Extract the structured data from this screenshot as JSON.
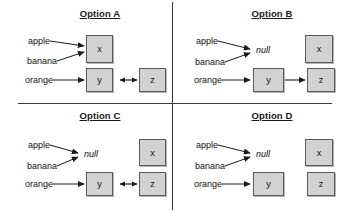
{
  "figure": {
    "layout": "2x2-quadrants",
    "colors": {
      "box_fill": "#d2d2d2",
      "box_border": "#5a5a5a",
      "line": "#1a1a1a",
      "background": "#ffffff"
    },
    "quadrants": [
      {
        "id": "option-a",
        "title": "Option A",
        "keys": [
          "apple",
          "banana",
          "orange"
        ],
        "null_label": null,
        "nodes": [
          {
            "id": "x",
            "label": "x",
            "col": 1,
            "row": 1
          },
          {
            "id": "y",
            "label": "y",
            "col": 1,
            "row": 2
          },
          {
            "id": "z",
            "label": "z",
            "col": 2,
            "row": 2
          }
        ],
        "edges": [
          {
            "from": "apple",
            "to": "x",
            "type": "arrow"
          },
          {
            "from": "banana",
            "to": "x",
            "type": "arrow"
          },
          {
            "from": "orange",
            "to": "y",
            "type": "arrow"
          },
          {
            "from": "y",
            "to": "z",
            "type": "double-arrow"
          }
        ]
      },
      {
        "id": "option-b",
        "title": "Option B",
        "keys": [
          "apple",
          "banana",
          "orange"
        ],
        "null_label": "null",
        "nodes": [
          {
            "id": "x",
            "label": "x",
            "col": 2,
            "row": 1
          },
          {
            "id": "y",
            "label": "y",
            "col": 1,
            "row": 2
          },
          {
            "id": "z",
            "label": "z",
            "col": 2,
            "row": 2
          }
        ],
        "edges": [
          {
            "from": "apple",
            "to": "null",
            "type": "arrow"
          },
          {
            "from": "banana",
            "to": "null",
            "type": "arrow"
          },
          {
            "from": "orange",
            "to": "y",
            "type": "arrow"
          },
          {
            "from": "y",
            "to": "z",
            "type": "arrow"
          }
        ]
      },
      {
        "id": "option-c",
        "title": "Option C",
        "keys": [
          "apple",
          "banana",
          "orange"
        ],
        "null_label": "null",
        "nodes": [
          {
            "id": "x",
            "label": "x",
            "col": 2,
            "row": 1
          },
          {
            "id": "y",
            "label": "y",
            "col": 1,
            "row": 2
          },
          {
            "id": "z",
            "label": "z",
            "col": 2,
            "row": 2
          }
        ],
        "edges": [
          {
            "from": "apple",
            "to": "null",
            "type": "arrow"
          },
          {
            "from": "banana",
            "to": "null",
            "type": "arrow"
          },
          {
            "from": "orange",
            "to": "y",
            "type": "arrow"
          },
          {
            "from": "y",
            "to": "z",
            "type": "double-arrow"
          }
        ]
      },
      {
        "id": "option-d",
        "title": "Option D",
        "keys": [
          "apple",
          "banana",
          "orange"
        ],
        "null_label": "null",
        "nodes": [
          {
            "id": "x",
            "label": "x",
            "col": 2,
            "row": 1
          },
          {
            "id": "y",
            "label": "y",
            "col": 1,
            "row": 2
          },
          {
            "id": "z",
            "label": "z",
            "col": 2,
            "row": 2
          }
        ],
        "edges": [
          {
            "from": "apple",
            "to": "null",
            "type": "arrow"
          },
          {
            "from": "banana",
            "to": "null",
            "type": "arrow"
          },
          {
            "from": "orange",
            "to": "y",
            "type": "arrow"
          }
        ]
      }
    ]
  },
  "a": {
    "title": "Option A",
    "apple": "apple",
    "banana": "banana",
    "orange": "orange",
    "x": "x",
    "y": "y",
    "z": "z"
  },
  "b": {
    "title": "Option B",
    "apple": "apple",
    "banana": "banana",
    "orange": "orange",
    "null": "null",
    "x": "x",
    "y": "y",
    "z": "z"
  },
  "c": {
    "title": "Option C",
    "apple": "apple",
    "banana": "banana",
    "orange": "orange",
    "null": "null",
    "x": "x",
    "y": "y",
    "z": "z"
  },
  "d": {
    "title": "Option D",
    "apple": "apple",
    "banana": "banana",
    "orange": "orange",
    "null": "null",
    "x": "x",
    "y": "y",
    "z": "z"
  }
}
